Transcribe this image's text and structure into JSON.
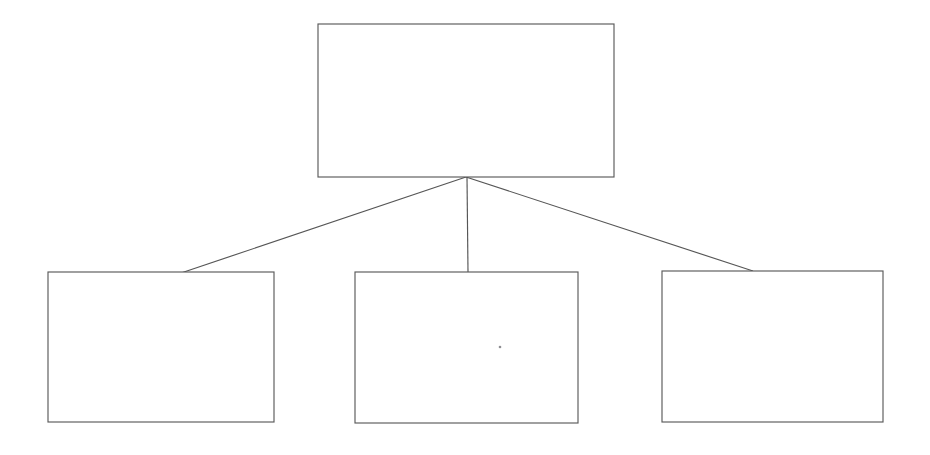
{
  "document": {
    "title": "Blank Hierarchy Diagram",
    "background_color": "#ffffff",
    "line_color": "#565656",
    "box_fill_color": "#ffffff",
    "width": 930,
    "height": 455
  },
  "diagram": {
    "type": "hierarchy-tree",
    "orientation": "top-down",
    "levels": 2,
    "parent": {
      "id": "node-parent",
      "label": "",
      "x": 318,
      "y": 24,
      "width": 296,
      "height": 153
    },
    "children": [
      {
        "id": "node-child-1",
        "label": "",
        "x": 48,
        "y": 272,
        "width": 226,
        "height": 150
      },
      {
        "id": "node-child-2",
        "label": "",
        "x": 355,
        "y": 272,
        "width": 223,
        "height": 151
      },
      {
        "id": "node-child-3",
        "label": "",
        "x": 662,
        "y": 271,
        "width": 221,
        "height": 151
      }
    ],
    "junction": {
      "x": 466,
      "y": 177
    },
    "connectors": [
      {
        "id": "connector-parent-to-child-1",
        "x1": 466,
        "y1": 177,
        "x2": 181,
        "y2": 273
      },
      {
        "id": "connector-parent-to-child-2",
        "x1": 467,
        "y1": 177,
        "x2": 468,
        "y2": 272
      },
      {
        "id": "connector-parent-to-child-3",
        "x1": 466,
        "y1": 177,
        "x2": 753,
        "y2": 271
      }
    ],
    "artifacts": [
      {
        "id": "scan-speck",
        "x": 500,
        "y": 347,
        "r": 1.3
      }
    ]
  }
}
